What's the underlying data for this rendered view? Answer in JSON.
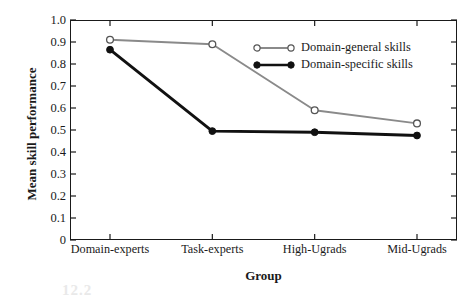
{
  "chart_data": {
    "type": "line",
    "title": "",
    "xlabel": "Group",
    "ylabel": "Mean skill performance",
    "categories": [
      "Domain-experts",
      "Task-experts",
      "High-Ugrads",
      "Mid-Ugrads"
    ],
    "ylim": [
      0,
      1.0
    ],
    "yticks": [
      "1.0",
      "0.9",
      "0.8",
      "0.7",
      "0.6",
      "0.5",
      "0.4",
      "0.3",
      "0.2",
      "0.1",
      "0"
    ],
    "ytick_values": [
      1.0,
      0.9,
      0.8,
      0.7,
      0.6,
      0.5,
      0.4,
      0.3,
      0.2,
      0.1,
      0
    ],
    "grid": false,
    "legend_position": "upper-right-inside",
    "series": [
      {
        "name": "Domain-general skills",
        "values": [
          0.91,
          0.89,
          0.59,
          0.53
        ],
        "color": "#8a8a8a",
        "marker": "open-circle"
      },
      {
        "name": "Domain-specific skills",
        "values": [
          0.865,
          0.495,
          0.49,
          0.475
        ],
        "color": "#111111",
        "marker": "filled-circle"
      }
    ]
  },
  "legend": {
    "items": [
      {
        "label": "Domain-general skills",
        "marker": "open-circle-line-icon"
      },
      {
        "label": "Domain-specific skills",
        "marker": "filled-circle-line-icon"
      }
    ]
  },
  "artifact": {
    "text": "12.2"
  }
}
